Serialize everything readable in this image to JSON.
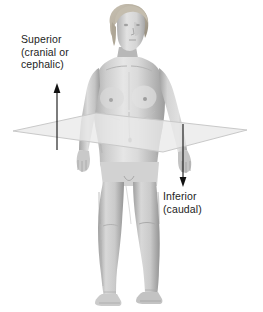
{
  "figure": {
    "background_color": "#ffffff",
    "width": 263,
    "height": 312
  },
  "labels": {
    "superior": {
      "lines": [
        "Superior",
        "(cranial or",
        "cephalic)"
      ],
      "color": "#1d1d1d",
      "arrow_direction": "up"
    },
    "inferior": {
      "lines": [
        "Inferior",
        "(caudal)"
      ],
      "color": "#1d1d1d",
      "arrow_direction": "down"
    }
  },
  "arrows": {
    "superior_arrow": {
      "x": 57,
      "y_tail": 150,
      "y_head": 84,
      "color": "#111111"
    },
    "inferior_arrow": {
      "x": 183,
      "y_tail": 124,
      "y_head": 186,
      "color": "#111111"
    }
  },
  "transverse_plane": {
    "name": "transverse-plane",
    "fill": "#ebebeb",
    "stroke": "#c8c8c8",
    "points": "13,131 96,113 247,130 163,152"
  },
  "human_figure": {
    "name": "standing-female-anatomical-figure",
    "skin_base": "#cfcfcf",
    "skin_light": "#e4e4e4",
    "skin_shadow": "#9a9a9a",
    "hair_color": "#b8b2a6",
    "pose": "standing anterior view, arms at sides"
  }
}
